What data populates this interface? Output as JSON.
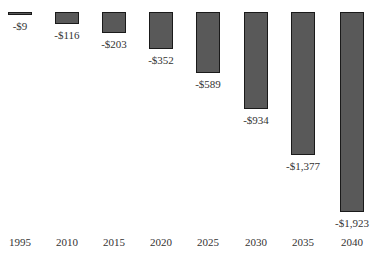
{
  "chart_data": {
    "type": "bar",
    "title": "",
    "xlabel": "",
    "ylabel": "",
    "categories": [
      "1995",
      "2010",
      "2015",
      "2020",
      "2025",
      "2030",
      "2035",
      "2040"
    ],
    "values": [
      -9,
      -116,
      -203,
      -352,
      -589,
      -934,
      -1377,
      -1923
    ],
    "value_labels": [
      "-$9",
      "-$116",
      "-$203",
      "-$352",
      "-$589",
      "-$934",
      "-$1,377",
      "-$1,923"
    ],
    "ylim": [
      -1923,
      0
    ],
    "grid": false,
    "legend": null,
    "bar_color": "#595959",
    "bar_border_color": "#1a1a1a"
  }
}
